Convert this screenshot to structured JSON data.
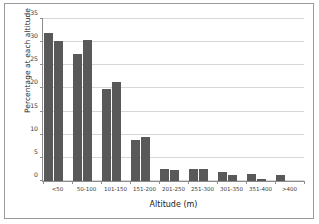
{
  "chart_data": {
    "type": "bar",
    "title": "",
    "xlabel": "Altitude (m)",
    "ylabel": "Percentage at each altitude",
    "categories": [
      "<50",
      "50-100",
      "101-150",
      "151-200",
      "201-250",
      "251-300",
      "301-350",
      "351-400",
      ">400"
    ],
    "series": [
      {
        "name": "Devon Tetrads",
        "values": [
          31.9,
          27.5,
          19.9,
          8.9,
          2.6,
          2.5,
          2.0,
          1.6,
          1.3
        ]
      },
      {
        "name": "Pheasant",
        "values": [
          30.2,
          30.5,
          21.3,
          9.6,
          2.4,
          2.5,
          1.3,
          0.5,
          0.0
        ]
      }
    ],
    "ylim": [
      0,
      35
    ],
    "yticks": [
      0,
      5,
      10,
      15,
      20,
      25,
      30,
      35
    ],
    "ytick_labels": [
      "0",
      "5",
      "10",
      "15",
      "20",
      "25",
      "30",
      "35"
    ],
    "grid": true,
    "legend_position": "top-center",
    "bar_color": "#595959",
    "gridline_color": "#d6d6d6",
    "axis_color": "#8c8c8c",
    "border_color": "#9a9a9a",
    "background_color": "#ffffff"
  }
}
